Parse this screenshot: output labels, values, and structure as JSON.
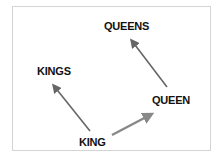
{
  "diagram": {
    "nodes": [
      {
        "id": "king",
        "label": "KING"
      },
      {
        "id": "queen",
        "label": "QUEEN"
      },
      {
        "id": "kings",
        "label": "KINGS"
      },
      {
        "id": "queens",
        "label": "QUEENS"
      }
    ],
    "edges": [
      {
        "from": "king",
        "to": "kings"
      },
      {
        "from": "king",
        "to": "queen"
      },
      {
        "from": "queen",
        "to": "queens"
      }
    ],
    "colors": {
      "arrow": "#6b6b6b",
      "arrow_light": "#8a8a8a",
      "text": "#111111",
      "border": "#d4d4d4"
    }
  }
}
